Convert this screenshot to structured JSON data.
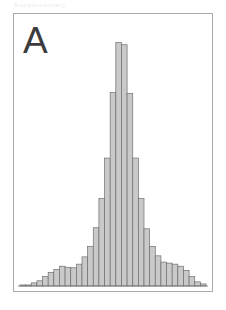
{
  "header": {
    "caption": "Supplementary"
  },
  "figure": {
    "panel_letter": "A",
    "frame_color": "#a9a9b0",
    "background_color": "#ffffff"
  },
  "chart_data": {
    "type": "bar",
    "title": "A",
    "subtitle": "",
    "xlabel": "",
    "ylabel": "",
    "grid": false,
    "legend": null,
    "legend_position": "none",
    "axis_visible": {
      "x_baseline": true,
      "y_axis": false,
      "x_ticks": false,
      "y_ticks": false
    },
    "bar_fill_color": "#c9c9c9",
    "bar_stroke_color": "#6e6e6e",
    "bar_count": 33,
    "bin_width": 1,
    "xlim": [
      0,
      33
    ],
    "ylim": [
      0,
      100
    ],
    "categories": [
      "1",
      "2",
      "3",
      "4",
      "5",
      "6",
      "7",
      "8",
      "9",
      "10",
      "11",
      "12",
      "13",
      "14",
      "15",
      "16",
      "17",
      "18",
      "19",
      "20",
      "21",
      "22",
      "23",
      "24",
      "25",
      "26",
      "27",
      "28",
      "29",
      "30",
      "31",
      "32",
      "33"
    ],
    "values": [
      0.4,
      0.4,
      1.2,
      2.0,
      3.6,
      5.2,
      6.4,
      7.6,
      7.2,
      7.0,
      8.4,
      11.2,
      15.2,
      22.4,
      33.6,
      49.2,
      74.4,
      93.6,
      92.8,
      74.0,
      49.2,
      33.6,
      22.0,
      15.2,
      11.6,
      9.2,
      8.8,
      8.4,
      7.6,
      6.0,
      3.6,
      1.6,
      0.8
    ],
    "peak": {
      "category": "18",
      "value": 93.6
    }
  }
}
